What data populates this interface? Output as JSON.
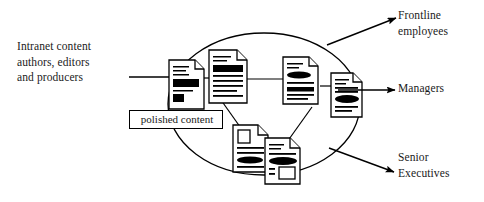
{
  "diagram": {
    "type": "content-flow-diagram",
    "background_color": "#ffffff",
    "stroke_color": "#000000",
    "text_color": "#1a1a1a",
    "source_label": "Intranet content\nauthors, editors\nand producers",
    "container_label": "polished content",
    "outputs": [
      {
        "label": "Frontline\nemployees"
      },
      {
        "label": "Managers"
      },
      {
        "label": "Senior\nExecutives"
      }
    ],
    "container_shape": "ellipse",
    "node_count": 6,
    "node_kind": "document-page"
  }
}
